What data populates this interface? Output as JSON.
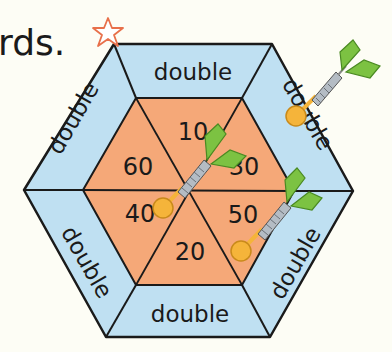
{
  "heading": {
    "text": "rds."
  },
  "colors": {
    "outer_ring": "#bfe0f2",
    "inner_board": "#f5a878",
    "outline": "#1a1a1a",
    "dart_flight": "#7cc242",
    "dart_barrel": "#b4bcc4",
    "dart_tip": "#f5b43a",
    "star": "#e8704a"
  },
  "board": {
    "outer_segments": [
      {
        "label": "double",
        "position": "top"
      },
      {
        "label": "double",
        "position": "upper-right"
      },
      {
        "label": "double",
        "position": "lower-right"
      },
      {
        "label": "double",
        "position": "bottom"
      },
      {
        "label": "double",
        "position": "lower-left"
      },
      {
        "label": "double",
        "position": "upper-left"
      }
    ],
    "inner_segments": [
      {
        "value": "10",
        "position": "top"
      },
      {
        "value": "30",
        "position": "upper-right"
      },
      {
        "value": "50",
        "position": "lower-right"
      },
      {
        "value": "20",
        "position": "bottom"
      },
      {
        "value": "40",
        "position": "lower-left"
      },
      {
        "value": "60",
        "position": "upper-left"
      }
    ]
  },
  "darts": [
    {
      "landed_in": "double",
      "segment": "upper-right"
    },
    {
      "landed_in": "40",
      "segment": "lower-left"
    },
    {
      "landed_in": "50",
      "segment": "lower-right"
    }
  ],
  "marker": {
    "icon": "star-icon"
  }
}
